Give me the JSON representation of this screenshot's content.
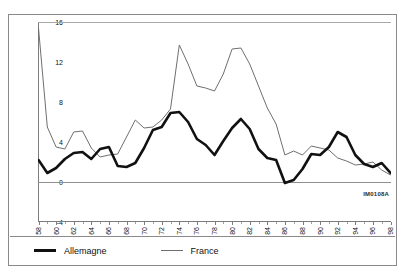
{
  "watermark": "IM0108A",
  "legend": {
    "items": [
      {
        "label": "Allemagne",
        "color": "#111111",
        "style": "thick-solid"
      },
      {
        "label": "France",
        "color": "#6f6f6f",
        "style": "thin-solid"
      }
    ]
  },
  "chart_data": {
    "type": "line",
    "title": "",
    "xlabel": "",
    "ylabel": "",
    "ylim": [
      -4,
      16
    ],
    "yticks": [
      16,
      12,
      8,
      4,
      0,
      -4
    ],
    "xlim": [
      58,
      98
    ],
    "xticks": [
      58,
      60,
      62,
      64,
      66,
      68,
      70,
      72,
      74,
      76,
      78,
      80,
      82,
      84,
      86,
      88,
      90,
      92,
      94,
      96,
      98
    ],
    "xtick_labels": [
      "58",
      "60",
      "62",
      "64",
      "66",
      "68",
      "70",
      "72",
      "74",
      "76",
      "78",
      "80",
      "82",
      "84",
      "86",
      "88",
      "90",
      "92",
      "94",
      "96",
      "98"
    ],
    "grid": true,
    "legend_position": "bottom-left",
    "x": [
      58,
      59,
      60,
      61,
      62,
      63,
      64,
      65,
      66,
      67,
      68,
      69,
      70,
      71,
      72,
      73,
      74,
      75,
      76,
      77,
      78,
      79,
      80,
      81,
      82,
      83,
      84,
      85,
      86,
      87,
      88,
      89,
      90,
      91,
      92,
      93,
      94,
      95,
      96,
      97,
      98
    ],
    "series": [
      {
        "name": "Allemagne",
        "color": "#111111",
        "values": [
          2.2,
          0.9,
          1.4,
          2.3,
          2.9,
          3.0,
          2.3,
          3.3,
          3.5,
          1.6,
          1.5,
          1.9,
          3.4,
          5.2,
          5.5,
          6.9,
          7.0,
          6.0,
          4.3,
          3.7,
          2.7,
          4.1,
          5.4,
          6.3,
          5.3,
          3.3,
          2.4,
          2.2,
          -0.1,
          0.2,
          1.3,
          2.8,
          2.7,
          3.5,
          5.0,
          4.5,
          2.7,
          1.8,
          1.5,
          1.9,
          0.9
        ]
      },
      {
        "name": "France",
        "color": "#6f6f6f",
        "values": [
          15.4,
          5.5,
          3.5,
          3.3,
          5.0,
          5.1,
          3.4,
          2.5,
          2.7,
          2.8,
          4.5,
          6.2,
          5.4,
          5.5,
          6.2,
          7.3,
          13.7,
          11.8,
          9.6,
          9.4,
          9.1,
          10.8,
          13.3,
          13.4,
          11.8,
          9.6,
          7.4,
          5.8,
          2.7,
          3.1,
          2.7,
          3.6,
          3.4,
          3.2,
          2.4,
          2.1,
          1.7,
          1.8,
          2.0,
          1.2,
          0.7
        ]
      }
    ]
  }
}
